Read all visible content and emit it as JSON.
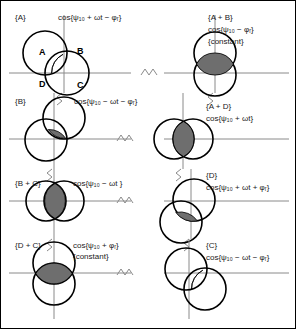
{
  "figure": {
    "colors": {
      "axis": "#808080",
      "circle_stroke": "#000000",
      "lens_fill": "#808080",
      "text": "#1a1a1a",
      "background": "#ffffff",
      "border": "#000000"
    },
    "break_symbol": "axis-break-zigzag"
  },
  "panels": [
    {
      "id": "panel-a",
      "group": "{A}",
      "expression": "cos{ψ₁₀ + ωt − φᵣ}",
      "note": "",
      "quadrant_labels": [
        "A",
        "B",
        "D",
        "C"
      ]
    },
    {
      "id": "panel-a-plus-b",
      "group": "{A + B}",
      "expression": "cos{ψ₁₀ − φᵣ}",
      "note": "{constant}",
      "quadrant_labels": []
    },
    {
      "id": "panel-b",
      "group": "{B}",
      "expression": "cos{ψ₁₀ − ωt − φᵣ}",
      "note": "",
      "quadrant_labels": []
    },
    {
      "id": "panel-a-plus-d",
      "group": "{A + D}",
      "expression": "cos{ψ₁₀ + ωt}",
      "note": "",
      "quadrant_labels": []
    },
    {
      "id": "panel-b-plus-c",
      "group": "{B + C}",
      "expression": "cos{ψ₁₀ − ωt }",
      "note": "",
      "quadrant_labels": []
    },
    {
      "id": "panel-d",
      "group": "{D}",
      "expression": "cos{ψ₁₀ + ωt + φᵣ}",
      "note": "",
      "quadrant_labels": []
    },
    {
      "id": "panel-d-plus-c",
      "group": "{D + C}",
      "expression": "cos{ψ₁₀ + φᵣ}",
      "note": "{constant}",
      "quadrant_labels": []
    },
    {
      "id": "panel-c",
      "group": "{C}",
      "expression": "cos{ψ₁₀ − ωt − φᵣ}",
      "note": "",
      "quadrant_labels": []
    }
  ]
}
